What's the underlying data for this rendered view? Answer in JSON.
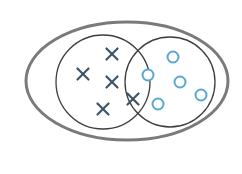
{
  "diagram": {
    "type": "venn",
    "colors": {
      "background": "#ffffff",
      "universe_stroke": "#7a7a78",
      "set_stroke": "#3e3e3e",
      "cross_marker": "#3f5566",
      "circle_marker": "#5aa8d0"
    },
    "universe": {
      "cx": 127,
      "cy": 81,
      "rx": 101,
      "ry": 59,
      "stroke_width": 3
    },
    "sets": [
      {
        "name": "set-a",
        "cx": 103,
        "cy": 82,
        "r": 47,
        "stroke_width": 1.3
      },
      {
        "name": "set-b",
        "cx": 170,
        "cy": 82,
        "r": 45,
        "stroke_width": 1.3
      }
    ],
    "cross_markers": [
      {
        "x": 112,
        "y": 54
      },
      {
        "x": 83,
        "y": 74
      },
      {
        "x": 112,
        "y": 82
      },
      {
        "x": 103,
        "y": 109
      },
      {
        "x": 133,
        "y": 99
      }
    ],
    "circle_markers": [
      {
        "x": 173,
        "y": 57
      },
      {
        "x": 148,
        "y": 75
      },
      {
        "x": 180,
        "y": 82
      },
      {
        "x": 201,
        "y": 95
      },
      {
        "x": 158,
        "y": 104
      }
    ],
    "marker_size": {
      "cross_half": 5.5,
      "circle_r": 5.5
    }
  }
}
